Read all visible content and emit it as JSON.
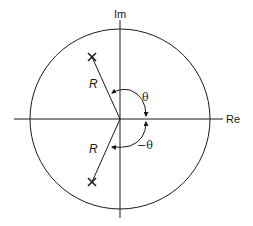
{
  "diagram": {
    "type": "z-plane pole diagram",
    "axes": {
      "horizontal_label": "Re",
      "vertical_label": "Im"
    },
    "unit_circle": true,
    "poles": [
      {
        "label": "R",
        "angle_label": "θ",
        "marker": "×",
        "position": "upper-left"
      },
      {
        "label": "R",
        "angle_label": "−θ",
        "marker": "×",
        "position": "lower-left"
      }
    ],
    "colors": {
      "stroke": "#1a1a1a",
      "background": "#ffffff"
    }
  }
}
